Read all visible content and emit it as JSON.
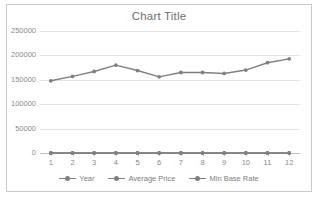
{
  "chart_data": {
    "type": "line",
    "title": "Chart Title",
    "xlabel": "",
    "ylabel": "",
    "categories": [
      "1",
      "2",
      "3",
      "4",
      "5",
      "6",
      "7",
      "8",
      "9",
      "10",
      "11",
      "12"
    ],
    "x": [
      1,
      2,
      3,
      4,
      5,
      6,
      7,
      8,
      9,
      10,
      11,
      12
    ],
    "ylim": [
      0,
      250000
    ],
    "yticks": [
      0,
      50000,
      100000,
      150000,
      200000,
      250000
    ],
    "ytick_labels": [
      "0",
      "50000",
      "100000",
      "150000",
      "200000",
      "250000"
    ],
    "grid": true,
    "legend_position": "bottom",
    "series": [
      {
        "name": "Year",
        "color": "#808080",
        "values": [
          1,
          2,
          3,
          4,
          5,
          6,
          7,
          8,
          9,
          10,
          11,
          12
        ]
      },
      {
        "name": "Average Price",
        "color": "#808080",
        "values": [
          148000,
          157000,
          167000,
          180000,
          169000,
          156000,
          165000,
          165000,
          163000,
          170000,
          185000,
          193000
        ]
      },
      {
        "name": "Min Base Rate",
        "color": "#808080",
        "values": [
          0,
          0,
          0,
          0,
          0,
          0,
          0,
          0,
          0,
          0,
          0,
          0
        ]
      }
    ]
  },
  "chart": {
    "title": "Chart Title",
    "frame_color": "#c9c9c9",
    "gridline_color": "#e4e4e4",
    "text_color": "#7b7b7b",
    "series_color": "#808080"
  }
}
